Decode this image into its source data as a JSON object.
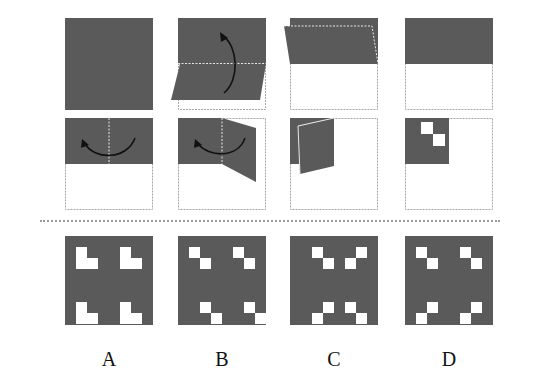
{
  "colors": {
    "paper": "#5a5a5a",
    "hole": "#ffffff",
    "outline": "#a8a8a8",
    "fold_line": "#e8e8e8",
    "arrow": "#111111"
  },
  "question": {
    "steps": [
      {
        "id": "step-1",
        "description": "Unfolded square sheet"
      },
      {
        "id": "step-2",
        "description": "Fold bottom half up along horizontal midline"
      },
      {
        "id": "step-3",
        "description": "Folded half-sheet lying at top"
      },
      {
        "id": "step-4",
        "description": "Top half remaining, bottom empty outline"
      },
      {
        "id": "step-5",
        "description": "Fold right half over to left along vertical midline"
      },
      {
        "id": "step-6",
        "description": "Right half folding toward left"
      },
      {
        "id": "step-7",
        "description": "Quarter-sheet being folded diagonally"
      },
      {
        "id": "step-8",
        "description": "Folded quarter with two diagonal punched holes"
      }
    ]
  },
  "options": [
    {
      "label": "A",
      "holes": [
        [
          1,
          1
        ],
        [
          2,
          1
        ],
        [
          2,
          2
        ],
        [
          1,
          5
        ],
        [
          2,
          5
        ],
        [
          2,
          6
        ],
        [
          6,
          1
        ],
        [
          7,
          1
        ],
        [
          7,
          2
        ],
        [
          6,
          5
        ],
        [
          7,
          5
        ],
        [
          7,
          6
        ]
      ],
      "pattern": "V-shapes top, inverted-V bottom"
    },
    {
      "label": "B",
      "holes": [
        [
          1,
          1
        ],
        [
          2,
          2
        ],
        [
          1,
          5
        ],
        [
          2,
          6
        ],
        [
          6,
          2
        ],
        [
          7,
          3
        ],
        [
          6,
          6
        ],
        [
          7,
          7
        ]
      ],
      "pattern": "diagonal pairs in each quadrant"
    },
    {
      "label": "C",
      "holes": [
        [
          1,
          2
        ],
        [
          2,
          3
        ],
        [
          1,
          6
        ],
        [
          2,
          5
        ],
        [
          6,
          3
        ],
        [
          7,
          2
        ],
        [
          6,
          5
        ],
        [
          7,
          6
        ]
      ],
      "pattern": "mirrored diagonal pairs forming X"
    },
    {
      "label": "D",
      "holes": [
        [
          1,
          1
        ],
        [
          2,
          2
        ],
        [
          1,
          5
        ],
        [
          2,
          6
        ],
        [
          6,
          2
        ],
        [
          7,
          1
        ],
        [
          6,
          6
        ],
        [
          7,
          5
        ]
      ],
      "pattern": "top down-right, bottom down-left"
    }
  ]
}
